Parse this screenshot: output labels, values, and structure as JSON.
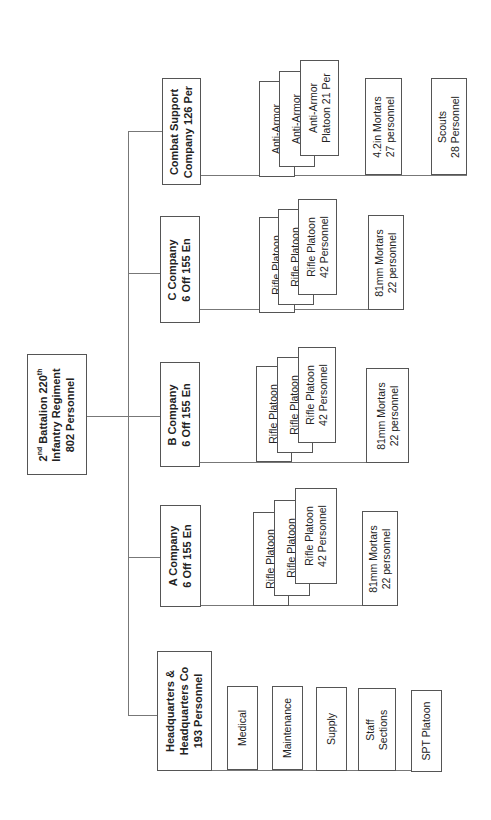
{
  "chart": {
    "root": {
      "line1": "2",
      "line1_sup": "nd",
      "line1_rest": " Battalion 220",
      "line1_sup2": "th",
      "line2": "Infantry Regiment",
      "line3": "802 Personnel"
    },
    "companies": [
      {
        "name": "Combat Support",
        "line2": "Company 126 Per",
        "children": [
          {
            "lines": [
              "Anti-Armor"
            ]
          },
          {
            "lines": [
              "Anti-Armor"
            ]
          },
          {
            "lines": [
              "Anti-Armor",
              "Platoon  21 Per"
            ]
          },
          {
            "lines": [
              "4.2in Mortars",
              "27 personnel"
            ]
          },
          {
            "lines": [
              "Scouts",
              "28 Personnel"
            ]
          }
        ]
      },
      {
        "name": "C Company",
        "line2": "6 Off  155 En",
        "children": [
          {
            "lines": [
              "Rifle Platoon"
            ]
          },
          {
            "lines": [
              "Rifle Platoon"
            ]
          },
          {
            "lines": [
              "Rifle Platoon",
              "42 Personnel"
            ]
          },
          {
            "lines": [
              "81mm Mortars",
              "22 personnel"
            ]
          }
        ]
      },
      {
        "name": "B Company",
        "line2": "6 Off  155 En",
        "children": [
          {
            "lines": [
              "Rifle Platoon"
            ]
          },
          {
            "lines": [
              "Rifle Platoon"
            ]
          },
          {
            "lines": [
              "Rifle Platoon",
              "42 Personnel"
            ]
          },
          {
            "lines": [
              "81mm Mortars",
              "22 personnel"
            ]
          }
        ]
      },
      {
        "name": "A Company",
        "line2": "6 Off  155 En",
        "children": [
          {
            "lines": [
              "Rifle Platoon"
            ]
          },
          {
            "lines": [
              "Rifle Platoon"
            ]
          },
          {
            "lines": [
              "Rifle Platoon",
              "42 Personnel"
            ]
          },
          {
            "lines": [
              "81mm Mortars",
              "22 personnel"
            ]
          }
        ]
      },
      {
        "name": "Headquarters &",
        "line2": "Headquarters Co",
        "line3": "193 Personnel",
        "children": [
          {
            "lines": [
              "Medical"
            ]
          },
          {
            "lines": [
              "Maintenance"
            ]
          },
          {
            "lines": [
              "Supply"
            ]
          },
          {
            "lines": [
              "Staff",
              "Sections"
            ]
          },
          {
            "lines": [
              "SPT Platoon"
            ]
          }
        ]
      }
    ]
  }
}
